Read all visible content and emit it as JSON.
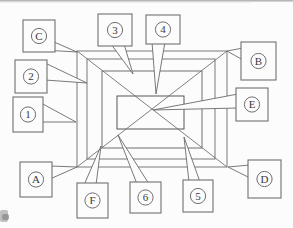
{
  "figure": {
    "type": "labeled-diagram",
    "colors": {
      "paper": "#fcfcfc",
      "rect_outer": "#787878",
      "rect_mid": "#6e6e6e",
      "rect_inner": "#565656",
      "diagonal": "#707070",
      "leader": "#6a6a6a",
      "box_border": "#6f6f6f",
      "box_fill": "#fcfcfc",
      "circle_border": "#5f5f5f",
      "label_text": "#3a3a3a",
      "scan_band": "#b6b6b6",
      "scan_band_soft": "#dedede",
      "artifact": "#8d8d8d"
    },
    "rectangles": [
      {
        "id": "region-rect-1",
        "x": 77,
        "y": 51,
        "w": 150,
        "h": 116
      },
      {
        "id": "region-rect-2",
        "x": 87,
        "y": 59,
        "w": 128,
        "h": 100
      },
      {
        "id": "region-rect-3",
        "x": 102,
        "y": 71,
        "w": 100,
        "h": 77
      },
      {
        "id": "region-rect-4",
        "x": 117,
        "y": 96,
        "w": 67,
        "h": 33
      }
    ],
    "diagonals": [
      {
        "id": "diagonal-tl-br",
        "x1": 77,
        "y1": 51,
        "x2": 227,
        "y2": 167
      },
      {
        "id": "diagonal-tr-bl",
        "x1": 227,
        "y1": 51,
        "x2": 77,
        "y2": 167
      }
    ],
    "callouts": [
      {
        "label": "C",
        "x": 23,
        "y": 20,
        "w": 32,
        "h": 32,
        "tail": [
          [
            43,
            50
          ],
          [
            54,
            42
          ]
        ],
        "tip": [
          77,
          52
        ]
      },
      {
        "label": "3",
        "x": 98,
        "y": 14,
        "w": 34,
        "h": 32,
        "tail": [
          [
            111,
            44
          ],
          [
            124,
            44
          ]
        ],
        "tip": [
          133,
          74
        ]
      },
      {
        "label": "4",
        "x": 146,
        "y": 15,
        "w": 34,
        "h": 29,
        "tail": [
          [
            152,
            42
          ],
          [
            165,
            42
          ]
        ],
        "tip": [
          156,
          94
        ]
      },
      {
        "label": "B",
        "x": 241,
        "y": 42,
        "w": 35,
        "h": 38,
        "tail": [
          [
            243,
            48
          ],
          [
            243,
            60
          ]
        ],
        "tip": [
          227,
          51
        ]
      },
      {
        "label": "2",
        "x": 15,
        "y": 60,
        "w": 32,
        "h": 33,
        "tail": [
          [
            45,
            63
          ],
          [
            45,
            80
          ]
        ],
        "tip": [
          87,
          83
        ]
      },
      {
        "label": "E",
        "x": 236,
        "y": 88,
        "w": 32,
        "h": 33,
        "tail": [
          [
            238,
            94
          ],
          [
            238,
            108
          ]
        ],
        "tip": [
          153,
          110
        ]
      },
      {
        "label": "1",
        "x": 13,
        "y": 97,
        "w": 30,
        "h": 35,
        "tail": [
          [
            41,
            103
          ],
          [
            41,
            122
          ]
        ],
        "tip": [
          76,
          122
        ]
      },
      {
        "label": "A",
        "x": 20,
        "y": 162,
        "w": 32,
        "h": 35,
        "tail": [
          [
            50,
            166
          ],
          [
            50,
            179
          ]
        ],
        "tip": [
          77,
          167
        ]
      },
      {
        "label": "F",
        "x": 77,
        "y": 183,
        "w": 31,
        "h": 35,
        "tail": [
          [
            84,
            185
          ],
          [
            96,
            185
          ]
        ],
        "tip": [
          101,
          146
        ]
      },
      {
        "label": "6",
        "x": 130,
        "y": 182,
        "w": 31,
        "h": 31,
        "tail": [
          [
            137,
            184
          ],
          [
            149,
            184
          ]
        ],
        "tip": [
          118,
          135
        ]
      },
      {
        "label": "5",
        "x": 183,
        "y": 180,
        "w": 30,
        "h": 32,
        "tail": [
          [
            189,
            182
          ],
          [
            200,
            182
          ]
        ],
        "tip": [
          184,
          137
        ]
      },
      {
        "label": "D",
        "x": 248,
        "y": 160,
        "w": 33,
        "h": 38,
        "tail": [
          [
            250,
            165
          ],
          [
            250,
            178
          ]
        ],
        "tip": [
          228,
          167
        ]
      }
    ],
    "artifacts": {
      "top_band": {
        "x": 0,
        "y": 0,
        "w": 293,
        "h": 1.6
      },
      "top_band2": {
        "x": 0,
        "y": 1.6,
        "w": 250,
        "h": 0.9
      },
      "corner_blob": {
        "x": 0,
        "y": 210,
        "w": 8,
        "h": 12
      },
      "corner_blob2": {
        "x": 2,
        "y": 214,
        "w": 7,
        "h": 6
      }
    }
  }
}
